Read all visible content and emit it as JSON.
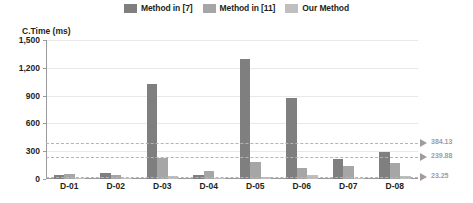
{
  "chart_data": {
    "type": "bar",
    "title": "",
    "xlabel": "",
    "ylabel": "C.Time (ms)",
    "categories": [
      "D-01",
      "D-02",
      "D-03",
      "D-04",
      "D-05",
      "D-06",
      "D-07",
      "D-08"
    ],
    "ylim": [
      0,
      1500
    ],
    "yticks": [
      0,
      300,
      600,
      900,
      1200,
      1500
    ],
    "ytick_labels": [
      "0",
      "300",
      "600",
      "900",
      "1,200",
      "1,500"
    ],
    "grid": true,
    "legend_position": "top-center",
    "series": [
      {
        "name": "Method in [7]",
        "color": "#7f7f7f",
        "values": [
          38,
          62,
          1030,
          38,
          1300,
          870,
          215,
          290
        ]
      },
      {
        "name": "Method in [11]",
        "color": "#a6a6a6",
        "values": [
          55,
          42,
          232,
          88,
          180,
          120,
          140,
          175
        ]
      },
      {
        "name": "Our Method",
        "color": "#bfbfbf",
        "values": [
          14,
          12,
          28,
          14,
          22,
          45,
          12,
          28
        ]
      }
    ],
    "annotations": [
      {
        "label": "384.13",
        "value": 384.13,
        "series": "Method in [7]",
        "color": "#a39aa0"
      },
      {
        "label": "239.88",
        "value": 239.88,
        "series": "Method in [11]",
        "color": "#a39aa0"
      },
      {
        "label": "23.25",
        "value": 23.25,
        "series": "Our Method",
        "color": "#a39aa0"
      }
    ]
  },
  "legend": {
    "items": [
      {
        "label": "Method in [7]"
      },
      {
        "label": "Method in [11]"
      },
      {
        "label": "Our Method"
      }
    ]
  }
}
